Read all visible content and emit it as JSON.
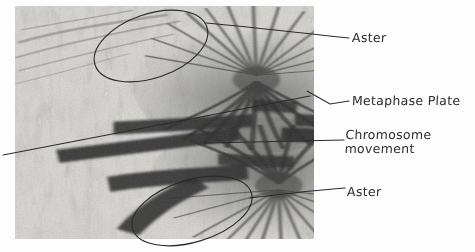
{
  "figure": {
    "name": "annotated-mitosis-micrograph",
    "background_color": "#fdfdfd",
    "ink_color": "#2c2c2c"
  },
  "micrograph": {
    "alt": "light micrograph of a dividing cell showing mitotic spindle, asters and chromosomes",
    "base_tone": "#c9c7c2",
    "specimen_color": "#3a3a3a"
  },
  "annotations": {
    "aster_top": {
      "label": "Aster",
      "callout": "ellipse"
    },
    "metaphase_plate": {
      "label": "Metaphase Plate",
      "callout": "line"
    },
    "chromosome_movement": {
      "label_line1": "Chromosome",
      "label_line2": "movement",
      "callout": "line"
    },
    "aster_bottom": {
      "label": "Aster",
      "callout": "ellipse"
    }
  }
}
